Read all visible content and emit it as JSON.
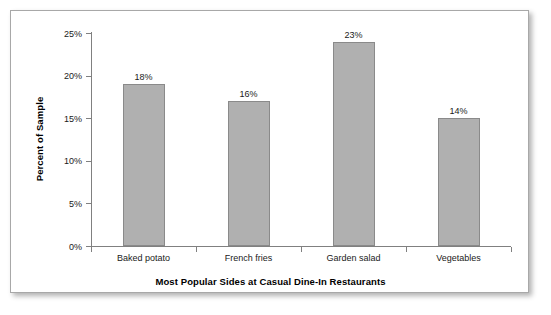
{
  "chart_data": {
    "type": "bar",
    "title": "",
    "xlabel": "Most Popular Sides at Casual Dine-In Restaurants",
    "ylabel": "Percent of Sample",
    "categories": [
      "Baked potato",
      "French fries",
      "Garden salad",
      "Vegetables"
    ],
    "values": [
      19,
      17,
      24,
      15
    ],
    "data_labels": [
      "18%",
      "16%",
      "23%",
      "14%"
    ],
    "ylim": [
      0,
      25
    ],
    "y_ticks": [
      0,
      5,
      10,
      15,
      20,
      25
    ],
    "y_tick_labels": [
      "0%",
      "5%",
      "10%",
      "15%",
      "20%",
      "25%"
    ],
    "grid": false,
    "legend": false,
    "bar_color": "#b0b0b0",
    "bar_border_color": "#8a8a8a",
    "axis_color": "#808080",
    "text_color": "#1a1a1a",
    "frame_border_color": "#a8a8a8",
    "background": "#ffffff"
  }
}
